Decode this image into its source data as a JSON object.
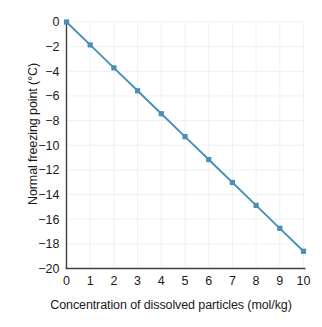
{
  "chart_data": {
    "type": "line",
    "title": "",
    "xlabel": "Concentration of dissolved particles (mol/kg)",
    "ylabel": "Normal freezing point (°C)",
    "x": [
      0,
      1,
      2,
      3,
      4,
      5,
      6,
      7,
      8,
      9,
      10
    ],
    "values": [
      0,
      -1.86,
      -3.72,
      -5.58,
      -7.44,
      -9.3,
      -11.16,
      -13.02,
      -14.88,
      -16.74,
      -18.6
    ],
    "series": [
      {
        "name": "Normal freezing point",
        "values": [
          0,
          -1.86,
          -3.72,
          -5.58,
          -7.44,
          -9.3,
          -11.16,
          -13.02,
          -14.88,
          -16.74,
          -18.6
        ]
      }
    ],
    "xlim": [
      0,
      10
    ],
    "ylim": [
      -20,
      0
    ],
    "xticks": [
      0,
      1,
      2,
      3,
      4,
      5,
      6,
      7,
      8,
      9,
      10
    ],
    "yticks": [
      0,
      -2,
      -4,
      -6,
      -8,
      -10,
      -12,
      -14,
      -16,
      -18,
      -20
    ],
    "xticklabels": [
      "0",
      "1",
      "2",
      "3",
      "4",
      "5",
      "6",
      "7",
      "8",
      "9",
      "10"
    ],
    "yticklabels": [
      "0",
      "−2",
      "−4",
      "−6",
      "−8",
      "−10",
      "−12",
      "−14",
      "−16",
      "−18",
      "−20"
    ],
    "grid": true,
    "legend": null,
    "marker": "square",
    "colors": {
      "line": "#4a8fb5",
      "marker": "#4a8fb5",
      "grid": "#eef1f3",
      "axis": "#3f3f3f",
      "text": "#1a1a1a",
      "background": "#ffffff"
    }
  }
}
